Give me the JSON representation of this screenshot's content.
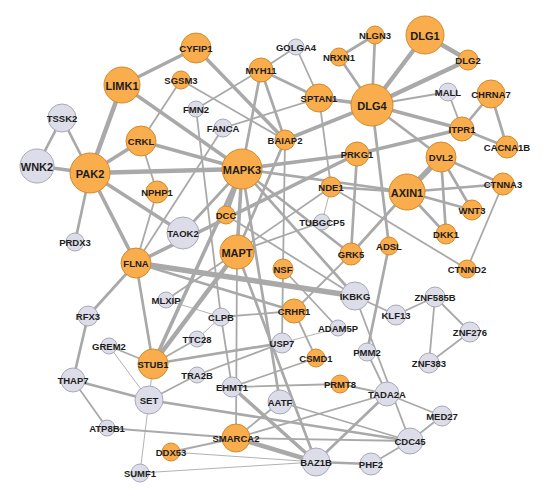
{
  "diagram": {
    "type": "protein-interaction-network",
    "colors": {
      "highlight_fill": "#f9ad4c",
      "highlight_stroke": "#d28a2c",
      "normal_fill": "#dcdde8",
      "normal_stroke": "#a7a9b8",
      "edge": "#a9a9a9",
      "label": "#1c1c1c"
    },
    "nodes": [
      {
        "id": "DLG1",
        "x": 425,
        "y": 35,
        "r": 19,
        "type": "highlight"
      },
      {
        "id": "DLG2",
        "x": 468,
        "y": 60,
        "r": 10,
        "type": "highlight"
      },
      {
        "id": "NLGN3",
        "x": 375,
        "y": 35,
        "r": 9,
        "type": "highlight"
      },
      {
        "id": "NRXN1",
        "x": 339,
        "y": 57,
        "r": 9,
        "type": "highlight"
      },
      {
        "id": "GOLGA4",
        "x": 296,
        "y": 47,
        "r": 8,
        "type": "normal"
      },
      {
        "id": "CYFIP1",
        "x": 196,
        "y": 48,
        "r": 15,
        "type": "highlight"
      },
      {
        "id": "MYH11",
        "x": 261,
        "y": 70,
        "r": 12,
        "type": "highlight"
      },
      {
        "id": "LIMK1",
        "x": 122,
        "y": 85,
        "r": 18,
        "type": "highlight"
      },
      {
        "id": "SGSM3",
        "x": 181,
        "y": 80,
        "r": 9,
        "type": "highlight"
      },
      {
        "id": "SPTAN1",
        "x": 319,
        "y": 98,
        "r": 14,
        "type": "highlight"
      },
      {
        "id": "DLG4",
        "x": 372,
        "y": 105,
        "r": 21,
        "type": "highlight"
      },
      {
        "id": "MALL",
        "x": 448,
        "y": 92,
        "r": 9,
        "type": "normal"
      },
      {
        "id": "CHRNA7",
        "x": 491,
        "y": 94,
        "r": 14,
        "type": "highlight"
      },
      {
        "id": "FMN2",
        "x": 196,
        "y": 109,
        "r": 8,
        "type": "normal"
      },
      {
        "id": "TSSK2",
        "x": 62,
        "y": 118,
        "r": 14,
        "type": "normal"
      },
      {
        "id": "FANCA",
        "x": 223,
        "y": 128,
        "r": 9,
        "type": "normal"
      },
      {
        "id": "BAIAP2",
        "x": 285,
        "y": 140,
        "r": 10,
        "type": "highlight"
      },
      {
        "id": "ITPR1",
        "x": 462,
        "y": 129,
        "r": 12,
        "type": "highlight"
      },
      {
        "id": "CACNA1B",
        "x": 507,
        "y": 147,
        "r": 11,
        "type": "highlight"
      },
      {
        "id": "CRKL",
        "x": 141,
        "y": 141,
        "r": 15,
        "type": "highlight"
      },
      {
        "id": "PRKG1",
        "x": 357,
        "y": 154,
        "r": 12,
        "type": "highlight"
      },
      {
        "id": "DVL2",
        "x": 441,
        "y": 157,
        "r": 15,
        "type": "highlight"
      },
      {
        "id": "WNK2",
        "x": 37,
        "y": 166,
        "r": 17,
        "type": "normal"
      },
      {
        "id": "PAK2",
        "x": 90,
        "y": 173,
        "r": 20,
        "type": "highlight"
      },
      {
        "id": "MAPK3",
        "x": 242,
        "y": 169,
        "r": 20,
        "type": "highlight"
      },
      {
        "id": "NDE1",
        "x": 331,
        "y": 187,
        "r": 10,
        "type": "highlight"
      },
      {
        "id": "AXIN1",
        "x": 407,
        "y": 192,
        "r": 18,
        "type": "highlight"
      },
      {
        "id": "CTNNA3",
        "x": 503,
        "y": 184,
        "r": 11,
        "type": "highlight"
      },
      {
        "id": "NPHP1",
        "x": 157,
        "y": 192,
        "r": 11,
        "type": "highlight"
      },
      {
        "id": "WNT3",
        "x": 472,
        "y": 210,
        "r": 10,
        "type": "highlight"
      },
      {
        "id": "DCC",
        "x": 226,
        "y": 215,
        "r": 9,
        "type": "highlight"
      },
      {
        "id": "TUBGCP5",
        "x": 322,
        "y": 222,
        "r": 8,
        "type": "normal"
      },
      {
        "id": "DKK1",
        "x": 446,
        "y": 234,
        "r": 10,
        "type": "highlight"
      },
      {
        "id": "TAOK2",
        "x": 183,
        "y": 233,
        "r": 16,
        "type": "normal"
      },
      {
        "id": "PRDX3",
        "x": 75,
        "y": 242,
        "r": 9,
        "type": "normal"
      },
      {
        "id": "ADSL",
        "x": 389,
        "y": 246,
        "r": 9,
        "type": "highlight"
      },
      {
        "id": "GRK5",
        "x": 351,
        "y": 254,
        "r": 11,
        "type": "highlight"
      },
      {
        "id": "MAPT",
        "x": 237,
        "y": 252,
        "r": 17,
        "type": "highlight"
      },
      {
        "id": "FLNA",
        "x": 136,
        "y": 263,
        "r": 15,
        "type": "highlight"
      },
      {
        "id": "CTNND2",
        "x": 467,
        "y": 269,
        "r": 9,
        "type": "highlight"
      },
      {
        "id": "NSF",
        "x": 283,
        "y": 269,
        "r": 10,
        "type": "highlight"
      },
      {
        "id": "MLXIP",
        "x": 166,
        "y": 300,
        "r": 8,
        "type": "normal"
      },
      {
        "id": "IKBKG",
        "x": 355,
        "y": 296,
        "r": 14,
        "type": "normal"
      },
      {
        "id": "ZNF585B",
        "x": 435,
        "y": 297,
        "r": 10,
        "type": "normal"
      },
      {
        "id": "CRHR1",
        "x": 294,
        "y": 311,
        "r": 12,
        "type": "highlight"
      },
      {
        "id": "CLPB",
        "x": 221,
        "y": 317,
        "r": 9,
        "type": "normal"
      },
      {
        "id": "KLF13",
        "x": 396,
        "y": 315,
        "r": 10,
        "type": "normal"
      },
      {
        "id": "RFX3",
        "x": 88,
        "y": 316,
        "r": 10,
        "type": "normal"
      },
      {
        "id": "ADAM5P",
        "x": 338,
        "y": 328,
        "r": 8,
        "type": "normal"
      },
      {
        "id": "ZNF276",
        "x": 470,
        "y": 332,
        "r": 10,
        "type": "normal"
      },
      {
        "id": "TTC28",
        "x": 197,
        "y": 339,
        "r": 8,
        "type": "normal"
      },
      {
        "id": "USP7",
        "x": 282,
        "y": 343,
        "r": 10,
        "type": "normal"
      },
      {
        "id": "GREM2",
        "x": 109,
        "y": 346,
        "r": 8,
        "type": "normal"
      },
      {
        "id": "PMM2",
        "x": 367,
        "y": 352,
        "r": 9,
        "type": "normal"
      },
      {
        "id": "CSMD1",
        "x": 316,
        "y": 358,
        "r": 9,
        "type": "highlight"
      },
      {
        "id": "STUB1",
        "x": 153,
        "y": 364,
        "r": 15,
        "type": "highlight"
      },
      {
        "id": "ZNF383",
        "x": 429,
        "y": 363,
        "r": 10,
        "type": "normal"
      },
      {
        "id": "TRA2B",
        "x": 197,
        "y": 375,
        "r": 8,
        "type": "normal"
      },
      {
        "id": "THAP7",
        "x": 73,
        "y": 380,
        "r": 12,
        "type": "normal"
      },
      {
        "id": "EHMT1",
        "x": 232,
        "y": 387,
        "r": 10,
        "type": "normal"
      },
      {
        "id": "PRMT8",
        "x": 340,
        "y": 384,
        "r": 9,
        "type": "highlight"
      },
      {
        "id": "TADA2A",
        "x": 387,
        "y": 394,
        "r": 12,
        "type": "normal"
      },
      {
        "id": "SET",
        "x": 149,
        "y": 400,
        "r": 14,
        "type": "normal"
      },
      {
        "id": "AATF",
        "x": 280,
        "y": 402,
        "r": 12,
        "type": "normal"
      },
      {
        "id": "MED27",
        "x": 442,
        "y": 416,
        "r": 10,
        "type": "normal"
      },
      {
        "id": "ATP8B1",
        "x": 107,
        "y": 428,
        "r": 8,
        "type": "normal"
      },
      {
        "id": "SMARCA2",
        "x": 236,
        "y": 438,
        "r": 14,
        "type": "highlight"
      },
      {
        "id": "CDC45",
        "x": 410,
        "y": 441,
        "r": 13,
        "type": "normal"
      },
      {
        "id": "DDX53",
        "x": 171,
        "y": 452,
        "r": 9,
        "type": "highlight"
      },
      {
        "id": "BAZ1B",
        "x": 316,
        "y": 462,
        "r": 14,
        "type": "normal"
      },
      {
        "id": "PHF2",
        "x": 371,
        "y": 464,
        "r": 11,
        "type": "normal"
      },
      {
        "id": "SUMF1",
        "x": 140,
        "y": 473,
        "r": 9,
        "type": "normal"
      }
    ],
    "edges": [
      [
        "DLG1",
        "DLG4",
        5
      ],
      [
        "DLG1",
        "DLG2",
        5
      ],
      [
        "NLGN3",
        "DLG4",
        3
      ],
      [
        "NRXN1",
        "DLG4",
        3
      ],
      [
        "NRXN1",
        "NLGN3",
        3
      ],
      [
        "DLG2",
        "DLG4",
        5
      ],
      [
        "MALL",
        "DLG4",
        2
      ],
      [
        "MALL",
        "ITPR1",
        2
      ],
      [
        "CHRNA7",
        "ITPR1",
        3
      ],
      [
        "CHRNA7",
        "CACNA1B",
        3
      ],
      [
        "ITPR1",
        "CACNA1B",
        3
      ],
      [
        "DLG4",
        "ITPR1",
        4
      ],
      [
        "DLG4",
        "SPTAN1",
        4
      ],
      [
        "DLG4",
        "BAIAP2",
        4
      ],
      [
        "DLG4",
        "DVL2",
        3
      ],
      [
        "DLG4",
        "ADSL",
        3
      ],
      [
        "ITPR1",
        "PRKG1",
        4
      ],
      [
        "SPTAN1",
        "MYH11",
        3
      ],
      [
        "SPTAN1",
        "NDE1",
        2
      ],
      [
        "SPTAN1",
        "FANCA",
        2
      ],
      [
        "SPTAN1",
        "GOLGA4",
        2
      ],
      [
        "GOLGA4",
        "MYH11",
        2
      ],
      [
        "MYH11",
        "BAIAP2",
        3
      ],
      [
        "MYH11",
        "FMN2",
        2
      ],
      [
        "MYH11",
        "MAPK3",
        3
      ],
      [
        "CYFIP1",
        "LIMK1",
        4
      ],
      [
        "CYFIP1",
        "BAIAP2",
        4
      ],
      [
        "SGSM3",
        "CRKL",
        2
      ],
      [
        "SGSM3",
        "BAIAP2",
        2
      ],
      [
        "LIMK1",
        "PAK2",
        5
      ],
      [
        "LIMK1",
        "MAPK3",
        4
      ],
      [
        "TSSK2",
        "PAK2",
        3
      ],
      [
        "TSSK2",
        "WNK2",
        3
      ],
      [
        "WNK2",
        "PAK2",
        4
      ],
      [
        "PAK2",
        "CRKL",
        4
      ],
      [
        "PAK2",
        "MAPK3",
        5
      ],
      [
        "PAK2",
        "FLNA",
        4
      ],
      [
        "PAK2",
        "TAOK2",
        4
      ],
      [
        "PAK2",
        "PRDX3",
        3
      ],
      [
        "CRKL",
        "NPHP1",
        2
      ],
      [
        "CRKL",
        "MAPK3",
        4
      ],
      [
        "NPHP1",
        "FLNA",
        2
      ],
      [
        "FANCA",
        "FLNA",
        2
      ],
      [
        "FMN2",
        "CLPB",
        2
      ],
      [
        "BAIAP2",
        "MAPT",
        3
      ],
      [
        "BAIAP2",
        "NSF",
        2
      ],
      [
        "MAPK3",
        "PRKG1",
        4
      ],
      [
        "MAPK3",
        "AXIN1",
        3
      ],
      [
        "MAPK3",
        "DCC",
        4
      ],
      [
        "MAPK3",
        "MAPT",
        4
      ],
      [
        "MAPK3",
        "TAOK2",
        3
      ],
      [
        "MAPK3",
        "IKBKG",
        3
      ],
      [
        "MAPK3",
        "STUB1",
        4
      ],
      [
        "MAPK3",
        "AATF",
        3
      ],
      [
        "MAPK3",
        "GRK5",
        3
      ],
      [
        "PRKG1",
        "FLNA",
        4
      ],
      [
        "PRKG1",
        "GRK5",
        3
      ],
      [
        "NDE1",
        "MAPT",
        2
      ],
      [
        "NDE1",
        "TUBGCP5",
        1
      ],
      [
        "NDE1",
        "AXIN1",
        3
      ],
      [
        "NDE1",
        "CTNND2",
        2
      ],
      [
        "AXIN1",
        "DVL2",
        6
      ],
      [
        "AXIN1",
        "CTNNA3",
        3
      ],
      [
        "AXIN1",
        "WNT3",
        3
      ],
      [
        "AXIN1",
        "DKK1",
        3
      ],
      [
        "AXIN1",
        "GRK5",
        3
      ],
      [
        "DVL2",
        "DKK1",
        3
      ],
      [
        "DVL2",
        "WNT3",
        3
      ],
      [
        "DVL2",
        "CTNNA3",
        3
      ],
      [
        "CTNNA3",
        "CTNND2",
        2
      ],
      [
        "DCC",
        "IKBKG",
        2
      ],
      [
        "TUBGCP5",
        "MAPT",
        2
      ],
      [
        "MAPT",
        "STUB1",
        5
      ],
      [
        "MAPT",
        "BAZ1B",
        3
      ],
      [
        "MAPT",
        "MLXIP",
        2
      ],
      [
        "FLNA",
        "IKBKG",
        6
      ],
      [
        "FLNA",
        "STUB1",
        3
      ],
      [
        "FLNA",
        "RFX3",
        3
      ],
      [
        "FLNA",
        "CRHR1",
        3
      ],
      [
        "GRK5",
        "CRHR1",
        2
      ],
      [
        "ADSL",
        "PMM2",
        3
      ],
      [
        "IKBKG",
        "KLF13",
        2
      ],
      [
        "NSF",
        "ADAM5P",
        2
      ],
      [
        "NSF",
        "USP7",
        2
      ],
      [
        "KLF13",
        "ZNF585B",
        2
      ],
      [
        "ZNF585B",
        "ZNF276",
        2
      ],
      [
        "ZNF585B",
        "ZNF383",
        2
      ],
      [
        "ZNF276",
        "ZNF383",
        2
      ],
      [
        "CRHR1",
        "CSMD1",
        2
      ],
      [
        "CRHR1",
        "CLPB",
        2
      ],
      [
        "MLXIP",
        "CLPB",
        1
      ],
      [
        "CLPB",
        "EHMT1",
        2
      ],
      [
        "CLPB",
        "TTC28",
        1
      ],
      [
        "TTC28",
        "STUB1",
        2
      ],
      [
        "ADAM5P",
        "USP7",
        1
      ],
      [
        "USP7",
        "STUB1",
        3
      ],
      [
        "USP7",
        "TRA2B",
        2
      ],
      [
        "GREM2",
        "STUB1",
        2
      ],
      [
        "GREM2",
        "SET",
        1
      ],
      [
        "RFX3",
        "THAP7",
        3
      ],
      [
        "STUB1",
        "SET",
        1
      ],
      [
        "TRA2B",
        "SET",
        2
      ],
      [
        "CSMD1",
        "EHMT1",
        2
      ],
      [
        "PMM2",
        "TADA2A",
        2
      ],
      [
        "EHMT1",
        "PRMT8",
        2
      ],
      [
        "EHMT1",
        "BAZ1B",
        4
      ],
      [
        "PRMT8",
        "TADA2A",
        2
      ],
      [
        "TADA2A",
        "MED27",
        2
      ],
      [
        "TADA2A",
        "BAZ1B",
        3
      ],
      [
        "TADA2A",
        "SMARCA2",
        2
      ],
      [
        "MED27",
        "CDC45",
        2
      ],
      [
        "THAP7",
        "SET",
        3
      ],
      [
        "THAP7",
        "ATP8B1",
        2
      ],
      [
        "SET",
        "SUMF1",
        1
      ],
      [
        "SET",
        "CDC45",
        3
      ],
      [
        "AATF",
        "SMARCA2",
        2
      ],
      [
        "AATF",
        "CDC45",
        2
      ],
      [
        "ATP8B1",
        "SMARCA2",
        2
      ],
      [
        "SMARCA2",
        "DDX53",
        2
      ],
      [
        "SMARCA2",
        "BAZ1B",
        5
      ],
      [
        "DDX53",
        "BAZ1B",
        1
      ],
      [
        "SUMF1",
        "BAZ1B",
        1
      ],
      [
        "BAZ1B",
        "PHF2",
        3
      ],
      [
        "PHF2",
        "CDC45",
        2
      ],
      [
        "CDC45",
        "SMARCA2",
        2
      ],
      [
        "MAPT",
        "SMARCA2",
        2
      ],
      [
        "IKBKG",
        "CDC45",
        2
      ]
    ]
  }
}
